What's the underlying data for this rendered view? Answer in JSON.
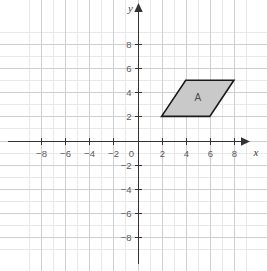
{
  "chart_data": {
    "type": "scatter",
    "title": "",
    "xlabel": "x",
    "ylabel": "y",
    "xlim": [
      -9.5,
      9.0
    ],
    "ylim": [
      -9.0,
      9.0
    ],
    "grid": true,
    "minor_grid_step": 1,
    "major_grid_step": 2,
    "legend": "none",
    "x_ticks": [
      -8,
      -6,
      -4,
      -2,
      0,
      2,
      4,
      6,
      8
    ],
    "x_tick_labels": [
      "−8",
      "−6",
      "−4",
      "−2",
      "0",
      "2",
      "4",
      "6",
      "8"
    ],
    "y_ticks": [
      -8,
      -6,
      -4,
      -2,
      2,
      4,
      6,
      8
    ],
    "y_tick_labels": [
      "−8",
      "−6",
      "−4",
      "−2",
      "2",
      "4",
      "6",
      "8"
    ],
    "origin_label": "0",
    "shapes": [
      {
        "name": "A",
        "type": "parallelogram",
        "label": "A",
        "label_position": [
          5,
          3.6
        ],
        "vertices": [
          [
            2,
            2
          ],
          [
            4,
            5
          ],
          [
            8,
            5
          ],
          [
            6,
            2
          ]
        ],
        "fill": "#c9c9c9",
        "stroke": "#1a1a1a"
      }
    ],
    "colors": {
      "background": "#ffffff",
      "minor_grid": "#e6e6e6",
      "major_grid": "#cfcfcf",
      "axis": "#333333",
      "tick_text": "#5a5a5a",
      "shape_fill": "#c9c9c9",
      "shape_stroke": "#1a1a1a"
    }
  }
}
